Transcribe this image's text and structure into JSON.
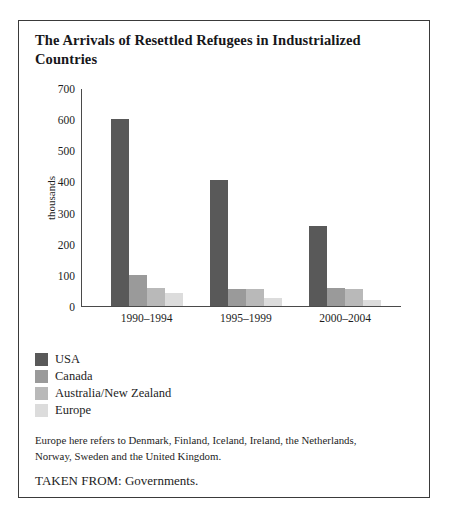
{
  "chart_data": {
    "type": "bar",
    "title": "The Arrivals of Resettled Refugees in Industrialized Countries",
    "xlabel": "",
    "ylabel": "thousands",
    "ylim": [
      0,
      700
    ],
    "ytick_step": 100,
    "yticks": [
      700,
      600,
      500,
      400,
      300,
      200,
      100,
      0
    ],
    "categories": [
      "1990–1994",
      "1995–1999",
      "2000–2004"
    ],
    "grid": false,
    "legend_position": "below-plot-left",
    "series": [
      {
        "name": "USA",
        "color": "#595959",
        "values": [
          600,
          405,
          255
        ]
      },
      {
        "name": "Canada",
        "color": "#9a9a9a",
        "values": [
          100,
          55,
          58
        ]
      },
      {
        "name": "Australia/New Zealand",
        "color": "#b9b9b9",
        "values": [
          58,
          55,
          55
        ]
      },
      {
        "name": "Europe",
        "color": "#dcdcdc",
        "values": [
          40,
          25,
          20
        ]
      }
    ],
    "footnote": "Europe here refers to Denmark, Finland, Iceland, Ireland, the Netherlands, Norway, Sweden and the United Kingdom.",
    "source": "TAKEN FROM: Governments."
  }
}
